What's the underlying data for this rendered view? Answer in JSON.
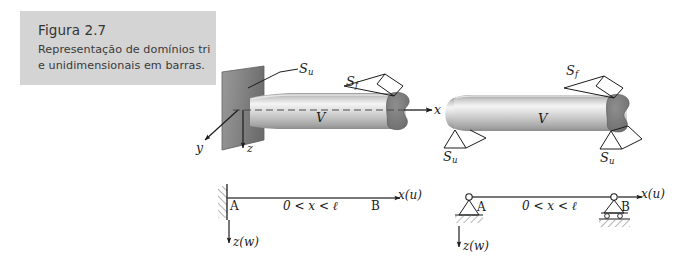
{
  "caption": {
    "title": "Figura 2.7",
    "line1": "Representação de domínios tri",
    "line2": "e unidimensionais em barras."
  },
  "colors": {
    "caption_bg": "#d4d4d4",
    "caption_text": "#333333",
    "ink": "#1c1c1c",
    "bar_light": "#f2f2f2",
    "bar_mid": "#b8b8b8",
    "bar_dark": "#8a8a8a",
    "endcap": "#7a7a7a",
    "plane": "#8e8e8e",
    "plane_dark": "#6e6e6e",
    "hatch": "#8a8a8a"
  },
  "figure3d_left": {
    "name": "three-dimensional-bar-fixed",
    "labels": {
      "su": "S",
      "su_sub": "u",
      "sf": "S",
      "sf_sub": "f",
      "volume": "V",
      "axis_x": "x",
      "axis_y": "y",
      "axis_z": "z"
    }
  },
  "figure3d_right": {
    "name": "three-dimensional-bar-supported",
    "labels": {
      "sf": "S",
      "sf_sub": "f",
      "volume": "V",
      "su_left": "S",
      "su_left_sub": "u",
      "su_right": "S",
      "su_right_sub": "u"
    }
  },
  "figure1d_left": {
    "name": "one-dimensional-cantilever-beam",
    "labels": {
      "node_a": "A",
      "node_b": "B",
      "domain": "0 < x < ℓ",
      "axis_x": "x(u)",
      "axis_z": "z(w)"
    }
  },
  "figure1d_right": {
    "name": "one-dimensional-simply-supported-beam",
    "labels": {
      "node_a": "A",
      "node_b": "B",
      "domain": "0 < x < ℓ",
      "axis_x": "x(u)",
      "axis_z": "z(w)"
    }
  }
}
